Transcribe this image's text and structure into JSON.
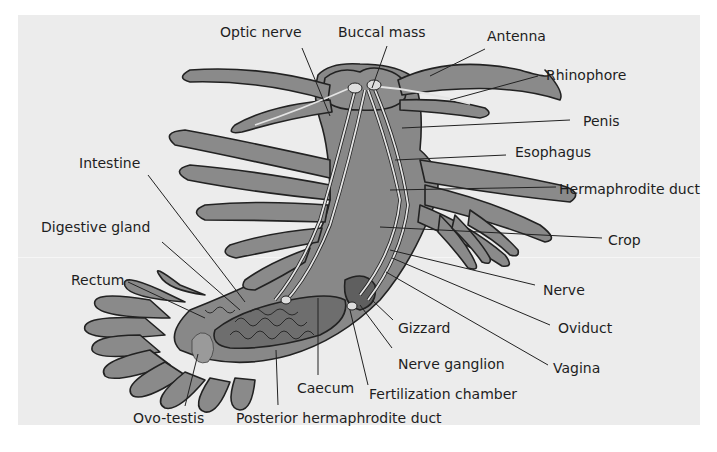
{
  "figure": {
    "colors": {
      "background": "#ececec",
      "body_fill": "#8a8a8a",
      "body_dark": "#6e6e6e",
      "outline": "#222222",
      "nerve": "#e4e4e4",
      "label_text": "#1e1e1e"
    },
    "labels": [
      {
        "id": "optic-nerve",
        "text": "Optic nerve"
      },
      {
        "id": "buccal-mass",
        "text": "Buccal mass"
      },
      {
        "id": "antenna",
        "text": "Antenna"
      },
      {
        "id": "rhinophore",
        "text": "Rhinophore"
      },
      {
        "id": "penis",
        "text": "Penis"
      },
      {
        "id": "esophagus",
        "text": "Esophagus"
      },
      {
        "id": "hermaphrodite-duct",
        "text": "Hermaphrodite duct"
      },
      {
        "id": "crop",
        "text": "Crop"
      },
      {
        "id": "intestine",
        "text": "Intestine"
      },
      {
        "id": "digestive-gland",
        "text": "Digestive gland"
      },
      {
        "id": "rectum",
        "text": "Rectum"
      },
      {
        "id": "nerve",
        "text": "Nerve"
      },
      {
        "id": "oviduct",
        "text": "Oviduct"
      },
      {
        "id": "gizzard",
        "text": "Gizzard"
      },
      {
        "id": "nerve-ganglion",
        "text": "Nerve ganglion"
      },
      {
        "id": "vagina",
        "text": "Vagina"
      },
      {
        "id": "caecum",
        "text": "Caecum"
      },
      {
        "id": "fertilization-chamber",
        "text": "Fertilization chamber"
      },
      {
        "id": "ovo-testis",
        "text": "Ovo-testis"
      },
      {
        "id": "posterior-hermaphrodite-duct",
        "text": "Posterior hermaphrodite duct"
      }
    ]
  }
}
